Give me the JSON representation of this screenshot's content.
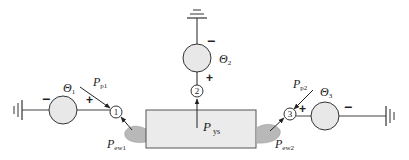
{
  "diagram": {
    "type": "circuit-like network diagram",
    "colors": {
      "line": "#333333",
      "source_fill": "#e8e8e8",
      "box_fill": "#ebebeb",
      "box_stroke": "#555555",
      "blob_fill": "#b8b8b8"
    },
    "nodes": [
      {
        "id": "1",
        "label": "1"
      },
      {
        "id": "2",
        "label": "2"
      },
      {
        "id": "3",
        "label": "3"
      }
    ],
    "sources": [
      {
        "id": "theta1",
        "symbol": "Θ",
        "subscript": "1",
        "plus": "+",
        "minus": "−"
      },
      {
        "id": "theta2",
        "symbol": "Θ",
        "subscript": "2",
        "plus": "+",
        "minus": "−"
      },
      {
        "id": "theta3",
        "symbol": "Θ",
        "subscript": "3",
        "plus": "+",
        "minus": "−"
      }
    ],
    "labels": {
      "pp1": {
        "main": "P",
        "sub": "p1"
      },
      "pp2": {
        "main": "P",
        "sub": "p2"
      },
      "pys": {
        "main": "P",
        "sub": "ys"
      },
      "pew1": {
        "main": "P",
        "sub": "ew1"
      },
      "pew2": {
        "main": "P",
        "sub": "ew2"
      }
    }
  }
}
